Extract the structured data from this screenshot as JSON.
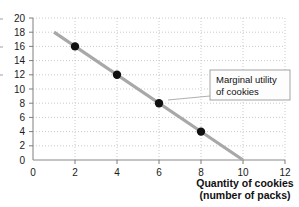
{
  "chart_data": {
    "type": "line",
    "title": "",
    "subtitle": "",
    "xlabel_line1": "Quantity of cookies",
    "xlabel_line2": "(number of packs)",
    "ylabel": "",
    "xlim": [
      0,
      12
    ],
    "ylim": [
      0,
      20
    ],
    "xticks": [
      0,
      2,
      4,
      6,
      8,
      10,
      12
    ],
    "xtick_labels": [
      "0",
      "2",
      "4",
      "6",
      "8",
      "10",
      "12"
    ],
    "yticks": [
      0,
      2,
      4,
      6,
      8,
      10,
      12,
      14,
      16,
      18,
      20
    ],
    "ytick_labels": [
      "0",
      "2",
      "4",
      "6",
      "8",
      "10",
      "12",
      "14",
      "16",
      "18",
      "20"
    ],
    "grid": true,
    "legend": "none",
    "series": [
      {
        "name": "Marginal utility of cookies",
        "line_endpoints": [
          [
            1,
            18
          ],
          [
            10,
            0
          ]
        ],
        "x": [
          2,
          4,
          6,
          8
        ],
        "values": [
          16,
          12,
          8,
          4
        ],
        "points": [
          {
            "x": 2,
            "y": 16
          },
          {
            "x": 4,
            "y": 12
          },
          {
            "x": 6,
            "y": 8
          },
          {
            "x": 8,
            "y": 4
          }
        ],
        "line_color": "#a8a8a8",
        "marker_color": "#111111"
      }
    ],
    "annotations": [
      {
        "name": "marginal-utility-callout",
        "text_line1": "Marginal utility",
        "text_line2": "of cookies",
        "box_x": 210,
        "box_y": 70,
        "box_w": 80,
        "box_h": 30,
        "pointer_to": [
          168,
          100
        ]
      }
    ]
  },
  "colors": {
    "line": "#a8a8a8",
    "marker": "#111111",
    "grid": "#bdbdbd",
    "axis": "#8a8a8a",
    "text": "#111111",
    "callout_fill": "#fdfdfd",
    "callout_border": "#9a9a9a"
  }
}
